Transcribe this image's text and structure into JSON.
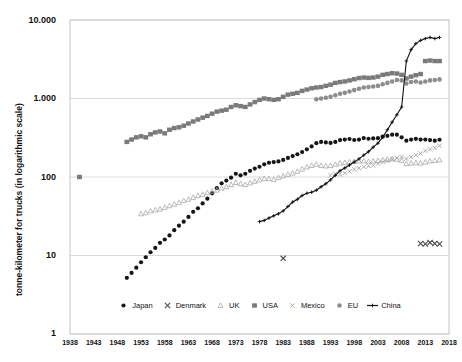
{
  "chart_data": {
    "type": "scatter",
    "title": "",
    "xlabel": "",
    "ylabel": "tonne-kilometer for trucks (in logarithmic scale)",
    "scale": "log",
    "grid": true,
    "legend_position": "bottom",
    "xlim": [
      1938,
      2018
    ],
    "ylim": [
      1,
      10000
    ],
    "ytick_labels": [
      "10.000",
      "1.000",
      "100",
      "10",
      "1"
    ],
    "ytick_values": [
      10000,
      1000,
      100,
      10,
      1
    ],
    "xtick_labels": [
      "1938",
      "1943",
      "1948",
      "1953",
      "1958",
      "1963",
      "1968",
      "1973",
      "1978",
      "1983",
      "1988",
      "1993",
      "1998",
      "2003",
      "2008",
      "2013",
      "2018"
    ],
    "xtick_values": [
      1938,
      1943,
      1948,
      1953,
      1958,
      1963,
      1968,
      1973,
      1978,
      1983,
      1988,
      1993,
      1998,
      2003,
      2008,
      2013,
      2018
    ],
    "series": [
      {
        "name": "Japan",
        "marker": "filled-circle",
        "color": "#161616",
        "x": [
          1950,
          1951,
          1952,
          1953,
          1954,
          1955,
          1956,
          1957,
          1958,
          1959,
          1960,
          1961,
          1962,
          1963,
          1964,
          1965,
          1966,
          1967,
          1968,
          1969,
          1970,
          1971,
          1972,
          1973,
          1974,
          1975,
          1976,
          1977,
          1978,
          1979,
          1980,
          1981,
          1982,
          1983,
          1984,
          1985,
          1986,
          1987,
          1988,
          1989,
          1990,
          1991,
          1992,
          1993,
          1994,
          1995,
          1996,
          1997,
          1998,
          1999,
          2000,
          2001,
          2002,
          2003,
          2004,
          2005,
          2006,
          2007,
          2008,
          2009,
          2010,
          2011,
          2012,
          2013,
          2014,
          2015,
          2016
        ],
        "y": [
          5.2,
          6.0,
          7.0,
          8.2,
          9.5,
          11,
          12.5,
          14.5,
          16,
          18,
          21,
          24,
          27,
          31,
          36,
          40,
          46,
          53,
          62,
          72,
          83,
          90,
          98,
          110,
          105,
          110,
          120,
          128,
          135,
          145,
          152,
          155,
          158,
          165,
          175,
          185,
          195,
          208,
          225,
          245,
          270,
          280,
          276,
          272,
          280,
          295,
          300,
          305,
          296,
          300,
          313,
          307,
          310,
          312,
          327,
          335,
          346,
          346,
          320,
          290,
          300,
          306,
          300,
          300,
          295,
          290,
          298
        ],
        "note": "Japan tonne-km rises from ~5 in 1950 to a ~340 peak around 2006-07, dips after 2008, ~300 by 2016"
      },
      {
        "name": "Denmark",
        "marker": "x-cross",
        "color": "#4a4a4a",
        "x": [
          1983,
          2012,
          2013,
          2014,
          2015,
          2016
        ],
        "y": [
          9.2,
          14.2,
          14.0,
          14.6,
          14.2,
          14.0
        ],
        "note": "Only sparse Denmark points visible: one near 1983 at ~9, a small cluster 2012-2016 at ~14"
      },
      {
        "name": "UK",
        "marker": "open-triangle",
        "color": "#a9a9a9",
        "x": [
          1953,
          1954,
          1955,
          1956,
          1957,
          1958,
          1959,
          1960,
          1961,
          1962,
          1963,
          1964,
          1965,
          1966,
          1967,
          1968,
          1969,
          1970,
          1971,
          1972,
          1973,
          1974,
          1975,
          1976,
          1977,
          1978,
          1979,
          1980,
          1981,
          1982,
          1983,
          1984,
          1985,
          1986,
          1987,
          1988,
          1989,
          1990,
          1991,
          1992,
          1993,
          1994,
          1995,
          1996,
          1997,
          1998,
          1999,
          2000,
          2001,
          2002,
          2003,
          2004,
          2005,
          2006,
          2007,
          2008,
          2009,
          2010,
          2011,
          2012,
          2013,
          2014,
          2015,
          2016
        ],
        "y": [
          34,
          35,
          37,
          38,
          39,
          41,
          43,
          45,
          47,
          50,
          52,
          55,
          58,
          60,
          63,
          66,
          68,
          72,
          75,
          80,
          85,
          82,
          80,
          84,
          88,
          92,
          96,
          95,
          93,
          98,
          103,
          108,
          112,
          118,
          126,
          134,
          140,
          145,
          140,
          138,
          140,
          145,
          150,
          152,
          156,
          158,
          160,
          160,
          158,
          160,
          162,
          165,
          168,
          170,
          168,
          162,
          148,
          150,
          152,
          150,
          155,
          160,
          162,
          165
        ],
        "note": "UK rises steadily from ~34 in 1953 to ~165 by 2016"
      },
      {
        "name": "USA",
        "marker": "filled-square",
        "color": "#7a7a7a",
        "x": [
          1940,
          1950,
          1951,
          1952,
          1953,
          1954,
          1955,
          1956,
          1957,
          1958,
          1959,
          1960,
          1961,
          1962,
          1963,
          1964,
          1965,
          1966,
          1967,
          1968,
          1969,
          1970,
          1971,
          1972,
          1973,
          1974,
          1975,
          1976,
          1977,
          1978,
          1979,
          1980,
          1981,
          1982,
          1983,
          1984,
          1985,
          1986,
          1987,
          1988,
          1989,
          1990,
          1991,
          1992,
          1993,
          1994,
          1995,
          1996,
          1997,
          1998,
          1999,
          2000,
          2001,
          2002,
          2003,
          2004,
          2005,
          2006,
          2007,
          2008,
          2009,
          2010,
          2011,
          2012,
          2013,
          2014,
          2015,
          2016
        ],
        "y": [
          100,
          280,
          300,
          320,
          330,
          320,
          350,
          370,
          380,
          360,
          400,
          420,
          430,
          450,
          480,
          510,
          540,
          570,
          600,
          640,
          680,
          700,
          720,
          780,
          820,
          800,
          780,
          840,
          900,
          960,
          1000,
          980,
          960,
          980,
          1050,
          1120,
          1150,
          1180,
          1250,
          1300,
          1350,
          1380,
          1400,
          1450,
          1500,
          1580,
          1620,
          1650,
          1700,
          1760,
          1820,
          1850,
          1830,
          1850,
          1900,
          2000,
          2050,
          2100,
          2080,
          2000,
          1800,
          1900,
          1980,
          2050,
          3000,
          3050,
          3000,
          3000
        ],
        "note": "USA grows from ~100 in 1940 through ~2000 in 2006, dips in 2009, jumps to ~3000 in 2013+"
      },
      {
        "name": "Mexico",
        "marker": "x-thin",
        "color": "#9a9a9a",
        "x": [
          1993,
          1994,
          1995,
          1996,
          1997,
          1998,
          1999,
          2000,
          2001,
          2002,
          2003,
          2004,
          2005,
          2006,
          2007,
          2008,
          2009,
          2010,
          2011,
          2012,
          2013,
          2014,
          2015,
          2016
        ],
        "y": [
          105,
          110,
          108,
          112,
          118,
          125,
          130,
          135,
          138,
          140,
          148,
          155,
          160,
          168,
          175,
          180,
          170,
          180,
          190,
          200,
          215,
          225,
          235,
          250
        ],
        "note": "Mexico appears from the mid-1990s, rising from ~105 to ~250"
      },
      {
        "name": "EU",
        "marker": "filled-circle-gray",
        "color": "#8d8d8d",
        "x": [
          1990,
          1991,
          1992,
          1993,
          1994,
          1995,
          1996,
          1997,
          1998,
          1999,
          2000,
          2001,
          2002,
          2003,
          2004,
          2005,
          2006,
          2007,
          2008,
          2009,
          2010,
          2011,
          2012,
          2013,
          2014,
          2015,
          2016
        ],
        "y": [
          980,
          1000,
          1020,
          1050,
          1100,
          1150,
          1180,
          1230,
          1280,
          1330,
          1380,
          1400,
          1420,
          1450,
          1520,
          1580,
          1650,
          1720,
          1700,
          1550,
          1620,
          1650,
          1600,
          1650,
          1700,
          1720,
          1750
        ],
        "note": "EU series starts around 1990 near 1000 and reaches ~1750 by 2016"
      },
      {
        "name": "China",
        "marker": "line-plus",
        "color": "#111111",
        "x": [
          1978,
          1979,
          1980,
          1981,
          1982,
          1983,
          1984,
          1985,
          1986,
          1987,
          1988,
          1989,
          1990,
          1991,
          1992,
          1993,
          1994,
          1995,
          1996,
          1997,
          1998,
          1999,
          2000,
          2001,
          2002,
          2003,
          2004,
          2005,
          2006,
          2007,
          2008,
          2009,
          2010,
          2011,
          2012,
          2013,
          2014,
          2015,
          2016
        ],
        "y": [
          27,
          28,
          30,
          32,
          34,
          37,
          42,
          48,
          52,
          58,
          62,
          64,
          68,
          75,
          82,
          92,
          105,
          120,
          130,
          142,
          155,
          170,
          190,
          210,
          240,
          270,
          320,
          400,
          500,
          620,
          780,
          3000,
          4200,
          5000,
          5500,
          5800,
          6000,
          5800,
          6000
        ],
        "note": "China flat-ish in the 1980s, accelerates after 2000 and explodes after 2008 to ~6000"
      }
    ]
  },
  "axes": {
    "y_title": "tonne-kilometer for trucks (in logarithmic scale)"
  },
  "legend": {
    "items": [
      {
        "label": "Japan",
        "marker": "filled-circle"
      },
      {
        "label": "Denmark",
        "marker": "x-cross"
      },
      {
        "label": "UK",
        "marker": "open-triangle"
      },
      {
        "label": "USA",
        "marker": "filled-square"
      },
      {
        "label": "Mexico",
        "marker": "x-thin"
      },
      {
        "label": "EU",
        "marker": "filled-circle-gray"
      },
      {
        "label": "China",
        "marker": "line-plus"
      }
    ]
  },
  "colors": {
    "japan": "#161616",
    "denmark": "#4a4a4a",
    "uk": "#a9a9a9",
    "usa": "#7a7a7a",
    "mexico": "#9a9a9a",
    "eu": "#8d8d8d",
    "china": "#111111",
    "grid": "#d0d0d0",
    "axis": "#b5b5b5",
    "background": "#ffffff"
  }
}
